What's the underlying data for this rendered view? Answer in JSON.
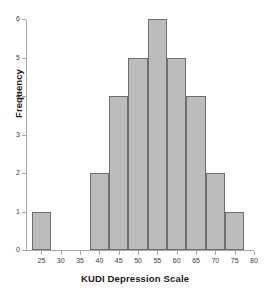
{
  "chart_data": {
    "type": "bar",
    "title": "",
    "xlabel": "KUDI Depression Scale",
    "ylabel": "Frequency",
    "xlim": [
      21,
      80
    ],
    "ylim": [
      0,
      6
    ],
    "grid": false,
    "legend": "none",
    "bin_width": 5,
    "x_tick_labels": [
      "25",
      "30",
      "35",
      "40",
      "45",
      "50",
      "55",
      "60",
      "65",
      "70",
      "75",
      "80"
    ],
    "x_tick_values": [
      25,
      30,
      35,
      40,
      45,
      50,
      55,
      60,
      65,
      70,
      75,
      80
    ],
    "y_tick_labels": [
      "0",
      "1",
      "2",
      "3",
      "4",
      "5",
      "6"
    ],
    "y_tick_values": [
      0,
      1,
      2,
      3,
      4,
      5,
      6
    ],
    "bins": [
      {
        "bin_start": 22.5,
        "bin_end": 27.5,
        "center": 25,
        "value": 1
      },
      {
        "bin_start": 37.5,
        "bin_end": 42.5,
        "center": 40,
        "value": 2
      },
      {
        "bin_start": 42.5,
        "bin_end": 47.5,
        "center": 45,
        "value": 4
      },
      {
        "bin_start": 47.5,
        "bin_end": 52.5,
        "center": 50,
        "value": 5
      },
      {
        "bin_start": 52.5,
        "bin_end": 57.5,
        "center": 55,
        "value": 6
      },
      {
        "bin_start": 57.5,
        "bin_end": 62.5,
        "center": 60,
        "value": 5
      },
      {
        "bin_start": 62.5,
        "bin_end": 67.5,
        "center": 65,
        "value": 4
      },
      {
        "bin_start": 67.5,
        "bin_end": 72.5,
        "center": 70,
        "value": 2
      },
      {
        "bin_start": 72.5,
        "bin_end": 77.5,
        "center": 75,
        "value": 1
      }
    ],
    "categories": [
      25,
      40,
      45,
      50,
      55,
      60,
      65,
      70,
      75
    ],
    "values": [
      1,
      2,
      4,
      5,
      6,
      5,
      4,
      2,
      1
    ],
    "total_count": 30,
    "colors": {
      "bar_fill": "#bcbcbc",
      "bar_border": "#6e6e6e",
      "axis": "#a8a8a8",
      "text": "#1a1a1a",
      "tick_text": "#3a3a3a",
      "background": "#ffffff"
    }
  }
}
